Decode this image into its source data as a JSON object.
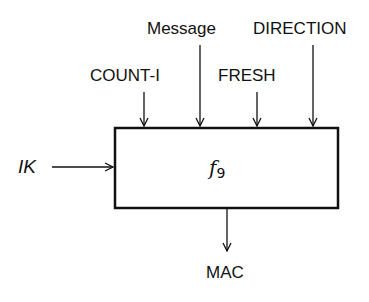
{
  "diagram": {
    "block": {
      "function_name": "f",
      "function_subscript": "9"
    },
    "inputs_top": [
      {
        "label": "COUNT-I",
        "x": 144
      },
      {
        "label": "Message",
        "x": 200
      },
      {
        "label": "FRESH",
        "x": 257
      },
      {
        "label": "DIRECTION",
        "x": 313
      }
    ],
    "input_left": {
      "label": "IK"
    },
    "output_bottom": {
      "label": "MAC"
    },
    "colors": {
      "stroke": "#111111",
      "background": "#ffffff"
    }
  }
}
